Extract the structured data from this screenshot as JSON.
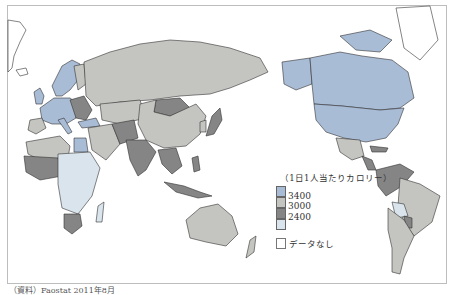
{
  "map": {
    "title": "1日1人当たりカロリー",
    "legend": {
      "title": "（1日1人当たりカロリー）",
      "classes": [
        {
          "label": "3400",
          "color": "#a9bcd6"
        },
        {
          "label": "3000",
          "color": "#c4c4c0"
        },
        {
          "label": "2400",
          "color": "#858585"
        },
        {
          "label": "",
          "color": "#d9e4ec"
        }
      ],
      "thresholds": [
        "3400",
        "3000",
        "2400"
      ],
      "no_data": {
        "label": "データなし",
        "color": "#ffffff"
      }
    },
    "colors": {
      "high": "#a9bcd6",
      "mid": "#c4c4c0",
      "low": "#858585",
      "lowest": "#d9e4ec",
      "no_data": "#ffffff",
      "border": "#333333"
    },
    "regions": [
      {
        "name": "North America (USA, Canada)",
        "class": "high"
      },
      {
        "name": "Western Europe",
        "class": "high"
      },
      {
        "name": "Russia",
        "class": "mid"
      },
      {
        "name": "China",
        "class": "mid"
      },
      {
        "name": "Mongolia",
        "class": "low"
      },
      {
        "name": "India",
        "class": "low"
      },
      {
        "name": "Southeast Asia",
        "class": "low"
      },
      {
        "name": "Japan",
        "class": "mid"
      },
      {
        "name": "Australia",
        "class": "mid"
      },
      {
        "name": "New Zealand",
        "class": "mid"
      },
      {
        "name": "Mexico",
        "class": "mid"
      },
      {
        "name": "Central America / Northern South America",
        "class": "low"
      },
      {
        "name": "Brazil",
        "class": "mid"
      },
      {
        "name": "Bolivia",
        "class": "lowest"
      },
      {
        "name": "Argentina / Chile",
        "class": "mid"
      },
      {
        "name": "North Africa",
        "class": "mid"
      },
      {
        "name": "Egypt",
        "class": "high"
      },
      {
        "name": "West Africa",
        "class": "low"
      },
      {
        "name": "East / Central Africa",
        "class": "lowest"
      },
      {
        "name": "South Africa",
        "class": "low"
      },
      {
        "name": "Middle East",
        "class": "mid"
      },
      {
        "name": "Greenland",
        "class": "no_data"
      }
    ]
  },
  "source": "（資料）Faostat 2011年8月"
}
